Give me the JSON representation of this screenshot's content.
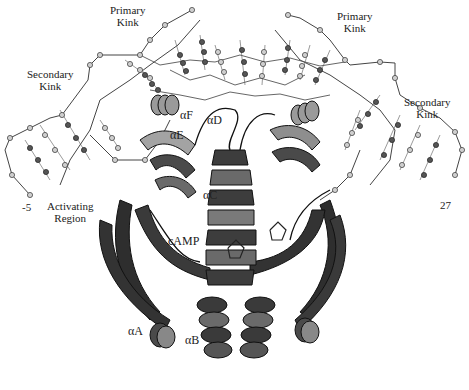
{
  "figure": {
    "colors": {
      "background": "#ffffff",
      "ribbon_dark": "#2b2b2b",
      "ribbon_mid": "#6a6a6a",
      "ribbon_light": "#a8a8a8",
      "dna_atom": "#bdbdbd",
      "text": "#222222"
    },
    "labels": {
      "primary_kink_left": "Primary\nKink",
      "primary_kink_right": "Primary\nKink",
      "secondary_kink_left": "Secondary\nKink",
      "secondary_kink_right": "Secondary\nKink",
      "alpha_f": "αF",
      "alpha_d": "αD",
      "alpha_e": "αE",
      "alpha_c": "αC",
      "camp": "cAMP",
      "activating_region": "Activating\nRegion",
      "alpha_a": "αA",
      "alpha_b": "αB",
      "dna_end_left": "-5",
      "dna_end_right": "27"
    }
  }
}
